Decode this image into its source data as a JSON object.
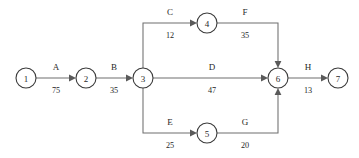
{
  "diagram": {
    "type": "activity-on-arrow-network",
    "title": "",
    "canvas": {
      "width": 359,
      "height": 158
    },
    "colors": {
      "background": "#ffffff",
      "node_stroke": "#3a3a3a",
      "node_fill": "#ffffff",
      "edge_stroke": "#6e6e6e",
      "arrow_fill": "#5a5a5a",
      "text": "#1f1f1f"
    },
    "nodes": [
      {
        "id": "node-1",
        "label": "1",
        "cx": 26,
        "cy": 78,
        "r": 10
      },
      {
        "id": "node-2",
        "label": "2",
        "cx": 86,
        "cy": 78,
        "r": 10
      },
      {
        "id": "node-3",
        "label": "3",
        "cx": 143,
        "cy": 78,
        "r": 10
      },
      {
        "id": "node-4",
        "label": "4",
        "cx": 207,
        "cy": 23,
        "r": 10
      },
      {
        "id": "node-5",
        "label": "5",
        "cx": 207,
        "cy": 133,
        "r": 10
      },
      {
        "id": "node-6",
        "label": "6",
        "cx": 278,
        "cy": 78,
        "r": 10
      },
      {
        "id": "node-7",
        "label": "7",
        "cx": 338,
        "cy": 78,
        "r": 10
      }
    ],
    "edges": [
      {
        "id": "edge-a",
        "name": "A",
        "duration": "75",
        "from": "1",
        "to": "2",
        "name_x": 56,
        "name_y": 70,
        "dur_x": 56,
        "dur_y": 93
      },
      {
        "id": "edge-b",
        "name": "B",
        "duration": "35",
        "from": "2",
        "to": "3",
        "name_x": 114,
        "name_y": 70,
        "dur_x": 114,
        "dur_y": 93
      },
      {
        "id": "edge-c",
        "name": "C",
        "duration": "12",
        "from": "3",
        "to": "4",
        "name_x": 170,
        "name_y": 15,
        "dur_x": 170,
        "dur_y": 38
      },
      {
        "id": "edge-d",
        "name": "D",
        "duration": "47",
        "from": "3",
        "to": "6",
        "name_x": 212,
        "name_y": 70,
        "dur_x": 212,
        "dur_y": 93
      },
      {
        "id": "edge-e",
        "name": "E",
        "duration": "25",
        "from": "3",
        "to": "5",
        "name_x": 170,
        "name_y": 125,
        "dur_x": 170,
        "dur_y": 148
      },
      {
        "id": "edge-f",
        "name": "F",
        "duration": "35",
        "from": "4",
        "to": "6",
        "name_x": 245,
        "name_y": 15,
        "dur_x": 245,
        "dur_y": 38
      },
      {
        "id": "edge-g",
        "name": "G",
        "duration": "20",
        "from": "5",
        "to": "6",
        "name_x": 245,
        "name_y": 125,
        "dur_x": 245,
        "dur_y": 148
      },
      {
        "id": "edge-h",
        "name": "H",
        "duration": "13",
        "from": "6",
        "to": "7",
        "name_x": 308,
        "name_y": 70,
        "dur_x": 308,
        "dur_y": 93
      }
    ]
  }
}
